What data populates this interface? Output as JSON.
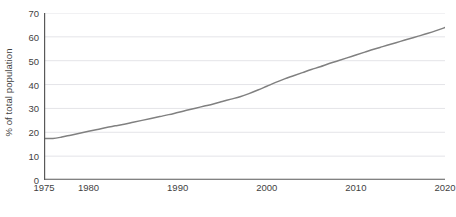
{
  "chart_data": {
    "type": "line",
    "title": "",
    "subtitle": "",
    "xlabel": "",
    "ylabel": "% of total population",
    "xlim": [
      1975,
      2020
    ],
    "ylim": [
      0,
      70
    ],
    "grid": true,
    "grid_axis": "y",
    "legend": false,
    "legend_position": "none",
    "line_color": "#808080",
    "axis_color": "#595959",
    "grid_color": "#e4e4e8",
    "tick_label_color": "#3f3f3f",
    "y_ticks": [
      0,
      10,
      20,
      30,
      40,
      50,
      60,
      70
    ],
    "y_tick_labels": [
      "0",
      "10",
      "20",
      "30",
      "40",
      "50",
      "60",
      "70"
    ],
    "x_ticks": [
      1975,
      1980,
      1990,
      2000,
      2010,
      2020
    ],
    "x_tick_labels": [
      "1975",
      "1980",
      "1990",
      "2000",
      "2010",
      "2020"
    ],
    "series": [
      {
        "name": "Urban population",
        "x": [
          1975,
          1976,
          1977,
          1978,
          1979,
          1980,
          1981,
          1982,
          1983,
          1984,
          1985,
          1986,
          1987,
          1988,
          1989,
          1990,
          1991,
          1992,
          1993,
          1994,
          1995,
          1996,
          1997,
          1998,
          1999,
          2000,
          2001,
          2002,
          2003,
          2004,
          2005,
          2006,
          2007,
          2008,
          2009,
          2010,
          2011,
          2012,
          2013,
          2014,
          2015,
          2016,
          2017,
          2018,
          2019,
          2020
        ],
        "values": [
          17.4,
          17.4,
          18.0,
          18.8,
          19.6,
          20.4,
          21.2,
          22.0,
          22.7,
          23.4,
          24.2,
          25.0,
          25.8,
          26.6,
          27.4,
          28.3,
          29.2,
          30.1,
          31.0,
          31.9,
          32.9,
          33.9,
          34.9,
          36.2,
          37.7,
          39.3,
          40.9,
          42.4,
          43.7,
          45.0,
          46.3,
          47.5,
          48.8,
          50.0,
          51.2,
          52.4,
          53.6,
          54.8,
          55.9,
          57.0,
          58.1,
          59.2,
          60.3,
          61.4,
          62.6,
          63.9
        ]
      }
    ]
  },
  "axis": {
    "y_title": "% of total population"
  },
  "caption": {
    "partial_text": ""
  }
}
